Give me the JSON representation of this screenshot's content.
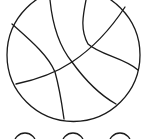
{
  "image": {
    "subject": "basketball coloring page",
    "stroke_color": "#1a1a1a",
    "background": "#ffffff"
  },
  "decorations": {
    "bottom_circles": 3
  }
}
